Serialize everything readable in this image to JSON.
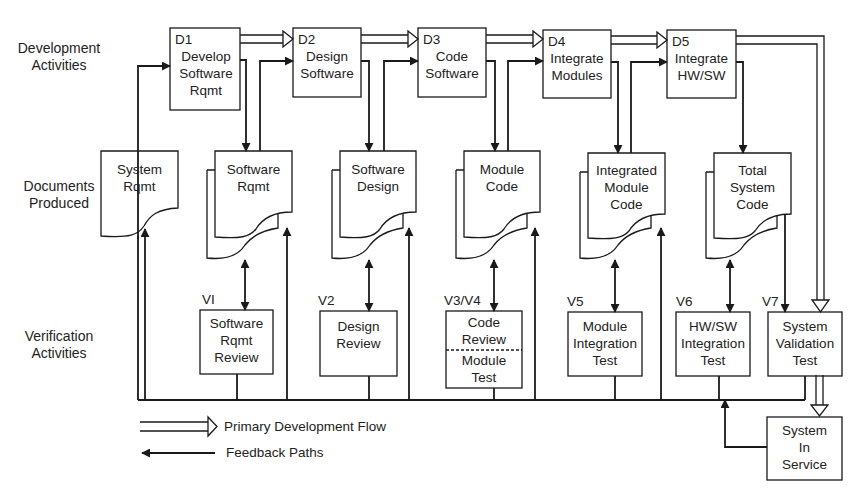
{
  "row_labels": {
    "development": [
      "Development",
      "Activities"
    ],
    "documents": [
      "Documents",
      "Produced"
    ],
    "verification": [
      "Verification",
      "Activities"
    ]
  },
  "development_activities": [
    {
      "id": "D1",
      "lines": [
        "Develop",
        "Software",
        "Rqmt"
      ]
    },
    {
      "id": "D2",
      "lines": [
        "Design",
        "Software"
      ]
    },
    {
      "id": "D3",
      "lines": [
        "Code",
        "Software"
      ]
    },
    {
      "id": "D4",
      "lines": [
        "Integrate",
        "Modules"
      ]
    },
    {
      "id": "D5",
      "lines": [
        "Integrate",
        "HW/SW"
      ]
    }
  ],
  "documents": [
    {
      "lines": [
        "System",
        "Rqmt"
      ]
    },
    {
      "lines": [
        "Software",
        "Rqmt"
      ]
    },
    {
      "lines": [
        "Software",
        "Design"
      ]
    },
    {
      "lines": [
        "Module",
        "Code"
      ]
    },
    {
      "lines": [
        "Integrated",
        "Module",
        "Code"
      ]
    },
    {
      "lines": [
        "Total",
        "System",
        "Code"
      ]
    }
  ],
  "verification_activities": [
    {
      "id": "VI",
      "lines": [
        "Software",
        "Rqmt",
        "Review"
      ]
    },
    {
      "id": "V2",
      "lines": [
        "Design",
        "Review"
      ]
    },
    {
      "id": "V3/V4",
      "lines": [
        "Code",
        "Review"
      ],
      "lines_lower": [
        "Module",
        "Test"
      ]
    },
    {
      "id": "V5",
      "lines": [
        "Module",
        "Integration",
        "Test"
      ]
    },
    {
      "id": "V6",
      "lines": [
        "HW/SW",
        "Integration",
        "Test"
      ]
    },
    {
      "id": "V7",
      "lines": [
        "System",
        "Validation",
        "Test"
      ]
    }
  ],
  "system_in_service": {
    "lines": [
      "System",
      "In",
      "Service"
    ]
  },
  "legend": {
    "primary_flow": "Primary Development Flow",
    "feedback": "Feedback Paths"
  },
  "colors": {
    "line": "#1a1a1a",
    "background": "#ffffff"
  }
}
